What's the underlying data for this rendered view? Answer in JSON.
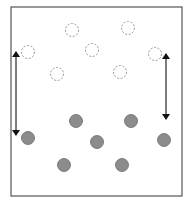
{
  "diagram": {
    "frame": {
      "x": 11,
      "y": 7,
      "width": 171,
      "height": 189,
      "stroke": "#555555"
    },
    "colors": {
      "filled_fill": "#8c8c8c",
      "filled_stroke": "#6a6a6a",
      "dashed_stroke": "#8a8a8a",
      "arrow": "#111111"
    },
    "circle_radius": 6.5,
    "dashed_circles": [
      {
        "cx": 72,
        "cy": 30
      },
      {
        "cx": 128,
        "cy": 28
      },
      {
        "cx": 28,
        "cy": 52
      },
      {
        "cx": 92,
        "cy": 50
      },
      {
        "cx": 155,
        "cy": 54
      },
      {
        "cx": 57,
        "cy": 74
      },
      {
        "cx": 120,
        "cy": 72
      }
    ],
    "filled_circles": [
      {
        "cx": 76,
        "cy": 121
      },
      {
        "cx": 131,
        "cy": 121
      },
      {
        "cx": 28,
        "cy": 138
      },
      {
        "cx": 97,
        "cy": 142
      },
      {
        "cx": 164,
        "cy": 140
      },
      {
        "cx": 64,
        "cy": 165
      },
      {
        "cx": 122,
        "cy": 165
      }
    ],
    "arrows": [
      {
        "x": 16,
        "y1": 50,
        "y2": 137
      },
      {
        "x": 166,
        "y1": 52,
        "y2": 121
      }
    ]
  }
}
